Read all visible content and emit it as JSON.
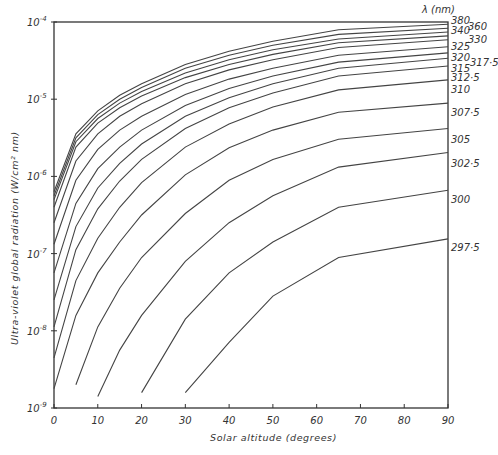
{
  "chart_data": {
    "type": "line",
    "title": "",
    "xlabel": "Solar altitude (degrees)",
    "ylabel": "Ultra-violet global radiation (W/cm² nm)",
    "legend_title": "λ (nm)",
    "xlim": [
      0,
      90
    ],
    "ylim": [
      1e-09,
      0.0001
    ],
    "yscale": "log",
    "grid": false,
    "legend_position": "right edge, labels at line ends",
    "x_ticks": [
      "0",
      "10",
      "20",
      "30",
      "40",
      "50",
      "60",
      "70",
      "80",
      "90"
    ],
    "y_ticks": [
      {
        "base": "10",
        "exp": "-4"
      },
      {
        "base": "10",
        "exp": "-5"
      },
      {
        "base": "10",
        "exp": "-6"
      },
      {
        "base": "10",
        "exp": "-7"
      },
      {
        "base": "10",
        "exp": "-8"
      },
      {
        "base": "10",
        "exp": "-9"
      }
    ],
    "series": [
      {
        "name": "380",
        "x": [
          0,
          5,
          10,
          15,
          20,
          30,
          40,
          50,
          65,
          90
        ],
        "log10_values": [
          -6.2,
          -5.45,
          -5.15,
          -4.95,
          -4.8,
          -4.55,
          -4.38,
          -4.25,
          -4.1,
          -4.03
        ]
      },
      {
        "name": "360",
        "x": [
          0,
          5,
          10,
          15,
          20,
          30,
          40,
          50,
          65,
          90
        ],
        "log10_values": [
          -6.25,
          -5.5,
          -5.2,
          -5.0,
          -4.85,
          -4.6,
          -4.43,
          -4.3,
          -4.16,
          -4.08
        ]
      },
      {
        "name": "340",
        "x": [
          0,
          5,
          10,
          15,
          20,
          30,
          40,
          50,
          65,
          90
        ],
        "log10_values": [
          -6.3,
          -5.55,
          -5.25,
          -5.05,
          -4.9,
          -4.66,
          -4.49,
          -4.36,
          -4.22,
          -4.13
        ]
      },
      {
        "name": "330",
        "x": [
          0,
          5,
          10,
          15,
          20,
          30,
          40,
          50,
          65,
          90
        ],
        "log10_values": [
          -6.4,
          -5.62,
          -5.31,
          -5.11,
          -4.96,
          -4.72,
          -4.55,
          -4.42,
          -4.27,
          -4.18
        ]
      },
      {
        "name": "325",
        "x": [
          0,
          5,
          10,
          15,
          20,
          30,
          40,
          50,
          65,
          90
        ],
        "log10_values": [
          -6.6,
          -5.8,
          -5.45,
          -5.22,
          -5.06,
          -4.8,
          -4.62,
          -4.49,
          -4.33,
          -4.23
        ]
      },
      {
        "name": "320",
        "x": [
          0,
          5,
          10,
          15,
          20,
          30,
          40,
          50,
          65,
          90
        ],
        "log10_values": [
          -6.88,
          -6.05,
          -5.65,
          -5.4,
          -5.22,
          -4.94,
          -4.74,
          -4.6,
          -4.43,
          -4.32
        ]
      },
      {
        "name": "317.5",
        "x": [
          0,
          5,
          10,
          15,
          20,
          30,
          40,
          50,
          65,
          90
        ],
        "log10_values": [
          -7.25,
          -6.35,
          -5.9,
          -5.62,
          -5.4,
          -5.08,
          -4.86,
          -4.7,
          -4.52,
          -4.4
        ]
      },
      {
        "name": "315",
        "x": [
          0,
          5,
          10,
          15,
          20,
          30,
          40,
          50,
          65,
          90
        ],
        "log10_values": [
          -7.6,
          -6.65,
          -6.15,
          -5.83,
          -5.58,
          -5.22,
          -4.98,
          -4.8,
          -4.6,
          -4.47
        ]
      },
      {
        "name": "312.5",
        "x": [
          0,
          5,
          10,
          15,
          20,
          30,
          40,
          50,
          65,
          90
        ],
        "log10_values": [
          -7.95,
          -6.95,
          -6.42,
          -6.06,
          -5.78,
          -5.38,
          -5.11,
          -4.92,
          -4.7,
          -4.57
        ]
      },
      {
        "name": "310",
        "x": [
          0,
          5,
          10,
          15,
          20,
          30,
          40,
          50,
          65,
          90
        ],
        "log10_values": [
          -8.35,
          -7.35,
          -6.8,
          -6.4,
          -6.08,
          -5.62,
          -5.32,
          -5.1,
          -4.88,
          -4.75
        ]
      },
      {
        "name": "307.5",
        "x": [
          0,
          5,
          10,
          15,
          20,
          30,
          40,
          50,
          65,
          90
        ],
        "log10_values": [
          -8.75,
          -7.8,
          -7.25,
          -6.85,
          -6.5,
          -5.98,
          -5.63,
          -5.4,
          -5.17,
          -5.05
        ]
      },
      {
        "name": "305",
        "x": [
          5,
          10,
          15,
          20,
          30,
          40,
          50,
          65,
          90
        ],
        "log10_values": [
          -8.7,
          -7.95,
          -7.45,
          -7.05,
          -6.48,
          -6.05,
          -5.78,
          -5.52,
          -5.38
        ]
      },
      {
        "name": "302.5",
        "x": [
          10,
          15,
          20,
          30,
          40,
          50,
          65,
          90
        ],
        "log10_values": [
          -8.85,
          -8.25,
          -7.8,
          -7.1,
          -6.6,
          -6.25,
          -5.88,
          -5.69
        ]
      },
      {
        "name": "300",
        "x": [
          20,
          30,
          40,
          50,
          65,
          90
        ],
        "log10_values": [
          -8.8,
          -7.85,
          -7.25,
          -6.85,
          -6.4,
          -6.18
        ]
      },
      {
        "name": "297.5",
        "x": [
          30,
          40,
          50,
          65,
          90
        ],
        "log10_values": [
          -8.8,
          -8.15,
          -7.55,
          -7.05,
          -6.81
        ]
      }
    ]
  }
}
